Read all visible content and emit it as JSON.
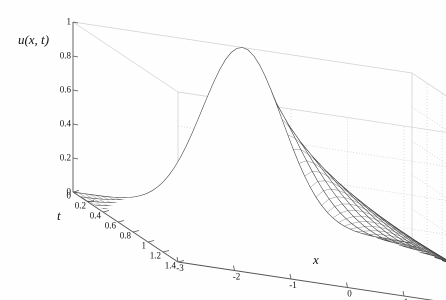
{
  "figure": {
    "kind": "surface-mesh-3d",
    "background_color": "#fefefe",
    "mesh_color": "#3a3a3a",
    "grid_color": "#c8c8c8",
    "axis_color": "#555555",
    "tick_text_color": "#101010"
  },
  "axes": {
    "z": {
      "title": "u(x, t)",
      "min": 0,
      "max": 1,
      "ticks": [
        0,
        0.2,
        0.4,
        0.6,
        0.8,
        1
      ],
      "tick_labels": [
        "0",
        "0.2",
        "0.4",
        "0.6",
        "0.8",
        "1"
      ]
    },
    "t": {
      "title": "t",
      "min": 0,
      "max": 1.4,
      "ticks": [
        0,
        0.2,
        0.4,
        0.6,
        0.8,
        1,
        1.2,
        1.4
      ],
      "tick_labels": [
        "0",
        "0.2",
        "0.4",
        "0.6",
        "0.8",
        "1",
        "1.2",
        "1.4"
      ]
    },
    "x": {
      "title": "x",
      "min": -3,
      "max": 3,
      "ticks": [
        -3,
        -2,
        -1,
        0,
        1,
        2,
        3
      ],
      "tick_labels": [
        "-3",
        "-2",
        "-1",
        "0",
        "1",
        "2",
        "3"
      ]
    }
  },
  "view": {
    "origin_px": [
      73,
      192
    ],
    "x_end_px": [
      412,
      243
    ],
    "t_end_px": [
      178,
      262
    ],
    "z_top_px": [
      73,
      22
    ],
    "grid_enabled": true,
    "box_enabled": true
  },
  "chart_data": {
    "type": "surface",
    "title": "",
    "xlabel": "x",
    "ylabel": "t",
    "zlabel": "u(x, t)",
    "xlim": [
      -3,
      3
    ],
    "ylim": [
      0,
      1.4
    ],
    "zlim": [
      0,
      1
    ],
    "grid": true,
    "legend": null,
    "function": "heat-equation-gaussian",
    "formula": "u(x,t) = exp(-x^2/(1+4*t)) / sqrt(1+4*t)",
    "mesh_nx": 61,
    "mesh_nt": 15,
    "peak_value_at_t0": 1.0,
    "x": [
      -3,
      -2.8,
      -2.6,
      -2.4,
      -2.2,
      -2,
      -1.8,
      -1.6,
      -1.4,
      -1.2,
      -1,
      -0.8,
      -0.6,
      -0.4,
      -0.2,
      0,
      0.2,
      0.4,
      0.6,
      0.8,
      1,
      1.2,
      1.4,
      1.6,
      1.8,
      2,
      2.2,
      2.4,
      2.6,
      2.8,
      3
    ],
    "t": [
      0,
      0.1,
      0.2,
      0.3,
      0.4,
      0.5,
      0.6,
      0.7,
      0.8,
      0.9,
      1,
      1.1,
      1.2,
      1.3,
      1.4
    ],
    "series": [
      {
        "name": "t=0",
        "values": [
          0.0001,
          0.0004,
          0.0012,
          0.0032,
          0.0079,
          0.0183,
          0.0392,
          0.0773,
          0.1409,
          0.2369,
          0.3679,
          0.5273,
          0.6977,
          0.8521,
          0.9608,
          1.0,
          0.9608,
          0.8521,
          0.6977,
          0.5273,
          0.3679,
          0.2369,
          0.1409,
          0.0773,
          0.0392,
          0.0183,
          0.0079,
          0.0032,
          0.0012,
          0.0004,
          0.0001
        ]
      },
      {
        "name": "t=0.2",
        "values": [
          0.0295,
          0.0429,
          0.0607,
          0.0836,
          0.1119,
          0.1455,
          0.1837,
          0.2252,
          0.2681,
          0.3099,
          0.3481,
          0.38,
          0.4033,
          0.4166,
          0.4211,
          0.4226,
          0.4211,
          0.4166,
          0.4033,
          0.38,
          0.3481,
          0.3099,
          0.2681,
          0.2252,
          0.1837,
          0.1455,
          0.1119,
          0.0836,
          0.0607,
          0.0429,
          0.0295
        ]
      },
      {
        "name": "t=0.4",
        "values": [
          0.0745,
          0.0925,
          0.1127,
          0.1345,
          0.157,
          0.1793,
          0.2002,
          0.2185,
          0.2333,
          0.2438,
          0.2497,
          0.2527,
          0.2541,
          0.255,
          0.2554,
          0.2556,
          0.2554,
          0.255,
          0.2541,
          0.2527,
          0.2497,
          0.2438,
          0.2333,
          0.2185,
          0.2002,
          0.1793,
          0.157,
          0.1345,
          0.1127,
          0.0925,
          0.0745
        ]
      },
      {
        "name": "t=0.6",
        "values": [
          0.0853,
          0.0985,
          0.1122,
          0.1258,
          0.1386,
          0.1501,
          0.1597,
          0.1671,
          0.1722,
          0.1751,
          0.1763,
          0.1767,
          0.1769,
          0.177,
          0.1771,
          0.1771,
          0.1771,
          0.177,
          0.1769,
          0.1767,
          0.1763,
          0.1751,
          0.1722,
          0.1671,
          0.1597,
          0.1501,
          0.1386,
          0.1258,
          0.1122,
          0.0985,
          0.0853
        ]
      },
      {
        "name": "t=0.8",
        "values": [
          0.0795,
          0.089,
          0.0984,
          0.1073,
          0.1152,
          0.1219,
          0.1271,
          0.1308,
          0.1331,
          0.1344,
          0.1349,
          0.1351,
          0.1352,
          0.1353,
          0.1353,
          0.1353,
          0.1353,
          0.1353,
          0.1352,
          0.1351,
          0.1349,
          0.1344,
          0.1331,
          0.1308,
          0.1271,
          0.1219,
          0.1152,
          0.1073,
          0.0984,
          0.089,
          0.0795
        ]
      },
      {
        "name": "t=1",
        "values": [
          0.0707,
          0.0778,
          0.0846,
          0.0908,
          0.0962,
          0.1006,
          0.104,
          0.1063,
          0.1078,
          0.1086,
          0.1089,
          0.109,
          0.1091,
          0.1091,
          0.1091,
          0.1091,
          0.1091,
          0.1091,
          0.1091,
          0.109,
          0.1089,
          0.1086,
          0.1078,
          0.1063,
          0.104,
          0.1006,
          0.0962,
          0.0908,
          0.0846,
          0.0778,
          0.0707
        ]
      },
      {
        "name": "t=1.2",
        "values": [
          0.0629,
          0.0684,
          0.0736,
          0.0782,
          0.0821,
          0.0853,
          0.0876,
          0.0892,
          0.0902,
          0.0908,
          0.091,
          0.0911,
          0.0911,
          0.0912,
          0.0912,
          0.0912,
          0.0912,
          0.0912,
          0.0911,
          0.0911,
          0.091,
          0.0908,
          0.0902,
          0.0892,
          0.0876,
          0.0853,
          0.0821,
          0.0782,
          0.0736,
          0.0684,
          0.0629
        ]
      },
      {
        "name": "t=1.4",
        "values": [
          0.0565,
          0.0608,
          0.0648,
          0.0684,
          0.0714,
          0.0738,
          0.0755,
          0.0767,
          0.0775,
          0.0779,
          0.0781,
          0.0782,
          0.0782,
          0.0782,
          0.0782,
          0.0782,
          0.0782,
          0.0782,
          0.0782,
          0.0782,
          0.0781,
          0.0779,
          0.0775,
          0.0767,
          0.0755,
          0.0738,
          0.0714,
          0.0684,
          0.0648,
          0.0608,
          0.0565
        ]
      }
    ]
  }
}
